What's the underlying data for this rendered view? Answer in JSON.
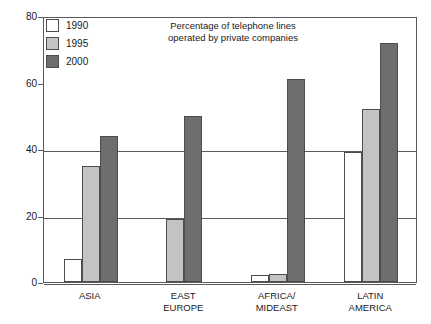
{
  "chart_data": {
    "type": "bar",
    "title": "Percentage of telephone lines operated by private companies",
    "title_line1": "Percentage of telephone lines",
    "title_line2": "operated by private companies",
    "xlabel": "",
    "ylabel": "",
    "ylim": [
      0,
      80
    ],
    "yticks": [
      0,
      20,
      40,
      60,
      80
    ],
    "ytick_labels": [
      "0",
      "20",
      "40",
      "60",
      "80"
    ],
    "grid": true,
    "grid_axis": "y",
    "legend_position": "upper-left",
    "categories": [
      "ASIA",
      "EAST EUROPE",
      "AFRICA/MIDEAST",
      "LATIN AMERICA"
    ],
    "category_labels": [
      "ASIA",
      "EAST\nEUROPE",
      "AFRICA/\nMIDEAST",
      "LATIN\nAMERICA"
    ],
    "series": [
      {
        "name": "1990",
        "color": "#ffffff",
        "values": [
          7,
          0,
          2,
          39
        ]
      },
      {
        "name": "1995",
        "color": "#c3c3c3",
        "values": [
          35,
          19,
          2.5,
          52
        ]
      },
      {
        "name": "2000",
        "color": "#6e6e6e",
        "values": [
          44,
          50,
          61,
          72
        ]
      }
    ]
  },
  "legend": {
    "items": [
      {
        "label": "1990",
        "swatch": "white-square-swatch"
      },
      {
        "label": "1995",
        "swatch": "light-gray-square-swatch"
      },
      {
        "label": "2000",
        "swatch": "dark-gray-square-swatch"
      }
    ]
  },
  "axis": {
    "y_labels": [
      "80",
      "60",
      "40",
      "20",
      "0"
    ]
  }
}
